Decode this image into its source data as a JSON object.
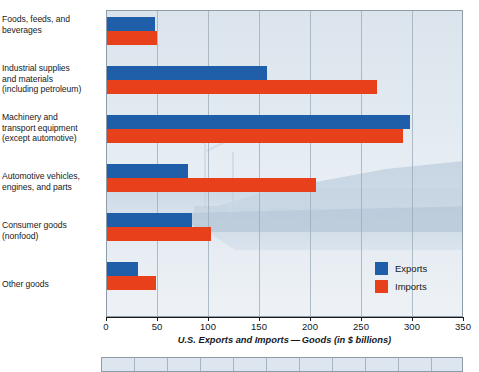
{
  "chart_data": {
    "type": "bar",
    "orientation": "horizontal",
    "title": "",
    "xlabel": "U.S. Exports and Imports — Goods (in $ billions)",
    "ylabel": "",
    "xlim": [
      0,
      350
    ],
    "xticks": [
      0,
      50,
      100,
      150,
      200,
      250,
      300,
      350
    ],
    "xtick_labels": [
      "0",
      "50",
      "100",
      "150",
      "200",
      "250",
      "300",
      "350"
    ],
    "grid": true,
    "legend_position": "bottom-right",
    "categories": [
      "Foods, feeds, and beverages",
      "Industrial supplies and materials (including petroleum)",
      "Machinery and transport equipment (except automotive)",
      "Automotive vehicles, engines, and parts",
      "Consumer goods (nonfood)",
      "Other goods"
    ],
    "series": [
      {
        "name": "Exports",
        "color": "#1f5fa9",
        "values": [
          48,
          158,
          298,
          80,
          84,
          31
        ]
      },
      {
        "name": "Imports",
        "color": "#e8401a",
        "values": [
          50,
          266,
          291,
          206,
          103,
          49
        ]
      }
    ]
  },
  "labels": {
    "lines": [
      [
        "Foods, feeds, and",
        "beverages"
      ],
      [
        "Industrial supplies",
        "and materials",
        "(including petroleum)"
      ],
      [
        "Machinery and",
        "transport equipment",
        "(except automotive)"
      ],
      [
        "Automotive vehicles,",
        "engines, and parts"
      ],
      [
        "Consumer goods",
        "(nonfood)"
      ],
      [
        "Other goods"
      ]
    ]
  },
  "legend": {
    "items": [
      {
        "label": "Exports",
        "color": "#1f5fa9"
      },
      {
        "label": "Imports",
        "color": "#e8401a"
      }
    ]
  },
  "axis": {
    "title": "U.S. Exports and Imports — Goods (in $ billions)",
    "tick_labels": [
      "0",
      "50",
      "100",
      "150",
      "200",
      "250",
      "300",
      "350"
    ]
  },
  "colors": {
    "exports": "#1f5fa9",
    "imports": "#e8401a",
    "plot_background": "#dde6ee",
    "gridline": "#9aa9b7"
  }
}
